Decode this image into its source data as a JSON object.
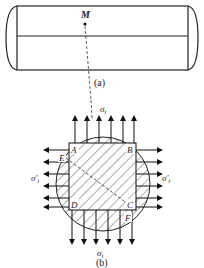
{
  "figure_a": {
    "point_label": "M",
    "caption": "(a)"
  },
  "figure_b": {
    "corners": [
      "A",
      "B",
      "C",
      "D"
    ],
    "extra_points": [
      "E",
      "F"
    ],
    "stress_top": "σ",
    "stress_top_sub": "t",
    "stress_bottom": "σ",
    "stress_bottom_sub": "t",
    "stress_left": "σ′",
    "stress_left_sub": "t",
    "stress_right": "σ′",
    "stress_right_sub": "t",
    "caption": "(b)"
  }
}
